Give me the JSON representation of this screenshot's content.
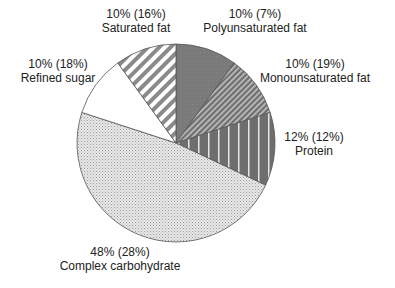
{
  "chart_data": {
    "type": "pie",
    "title": "",
    "start_angle_deg": 0,
    "direction": "clockwise",
    "note": "Primary percentage is the recommended share; value in parentheses is the current share",
    "slices": [
      {
        "name": "Polyunsaturated fat",
        "value": 10,
        "secondary_value": 7,
        "label_line1": "10% (7%)",
        "label_line2": "Polyunsaturated fat",
        "fill": "solid-gray",
        "color": "#7a7a7a"
      },
      {
        "name": "Monounsaturated fat",
        "value": 10,
        "secondary_value": 19,
        "label_line1": "10% (19%)",
        "label_line2": "Monounsaturated fat",
        "fill": "fine-diagonal-hatch",
        "color": "#8c8c8c"
      },
      {
        "name": "Protein",
        "value": 12,
        "secondary_value": 12,
        "label_line1": "12% (12%)",
        "label_line2": "Protein",
        "fill": "vertical-stripes",
        "color": "#6e6e6e"
      },
      {
        "name": "Complex carbohydrate",
        "value": 48,
        "secondary_value": 28,
        "label_line1": "48% (28%)",
        "label_line2": "Complex carbohydrate",
        "fill": "stipple",
        "color": "#dcdcdc"
      },
      {
        "name": "Refined sugar",
        "value": 10,
        "secondary_value": 18,
        "label_line1": "10% (18%)",
        "label_line2": "Refined sugar",
        "fill": "white",
        "color": "#ffffff"
      },
      {
        "name": "Saturated fat",
        "value": 10,
        "secondary_value": 16,
        "label_line1": "10% (16%)",
        "label_line2": "Saturated fat",
        "fill": "wide-diagonal-stripes",
        "color": "#9a9a9a"
      }
    ],
    "legend": "none (labels placed next to slices)"
  },
  "layout": {
    "cx": 176,
    "cy": 143,
    "r": 99,
    "label_positions": [
      {
        "x": 255,
        "y1": 18,
        "y2": 32
      },
      {
        "x": 315,
        "y1": 68,
        "y2": 82
      },
      {
        "x": 314,
        "y1": 141,
        "y2": 155
      },
      {
        "x": 120,
        "y1": 256,
        "y2": 270
      },
      {
        "x": 58,
        "y1": 68,
        "y2": 82
      },
      {
        "x": 136,
        "y1": 18,
        "y2": 32
      }
    ]
  }
}
